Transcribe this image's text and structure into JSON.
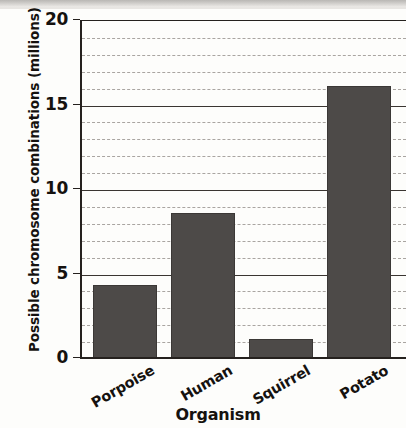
{
  "chart_data": {
    "type": "bar",
    "title": "",
    "xlabel": "Organism",
    "ylabel": "Possible chromosome combinations (millions)",
    "categories": [
      "Porpoise",
      "Human",
      "Squirrel",
      "Potato"
    ],
    "values": [
      4.3,
      8.6,
      1.1,
      16.1
    ],
    "ylim": [
      0,
      20
    ],
    "y_ticks": [
      0,
      5,
      10,
      15,
      20
    ],
    "y_tick_labels": [
      "0",
      "5",
      "10",
      "15",
      "20"
    ],
    "y_minor_tick_interval": 1,
    "grid": {
      "major_horizontal": true,
      "minor_horizontal": true,
      "minor_style": "dashed",
      "vertical": false
    },
    "legend": null,
    "bar_color": "#4d4a48",
    "bar_edge_color": "#3b3836",
    "axis_color": "#25211e",
    "background_color": "#fdfdfb",
    "xtick_label_rotation_degrees": -30
  }
}
